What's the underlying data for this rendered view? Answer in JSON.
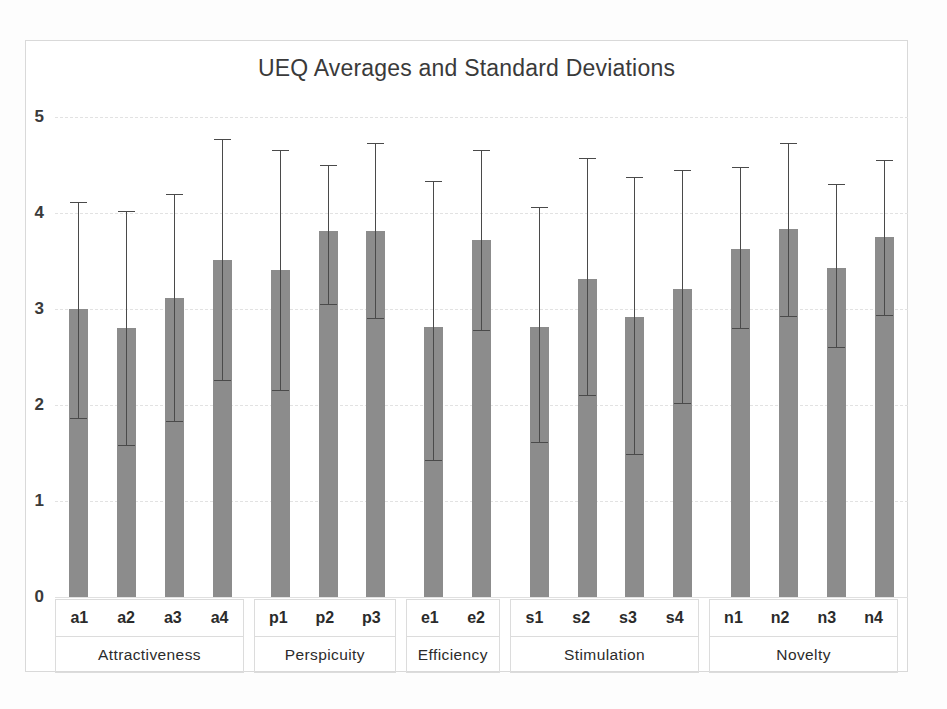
{
  "chart_data": {
    "type": "bar",
    "title": "UEQ Averages and Standard Deviations",
    "xlabel": "",
    "ylabel": "",
    "ylim": [
      0,
      5
    ],
    "yticks": [
      "0",
      "1",
      "2",
      "3",
      "4",
      "5"
    ],
    "grid": true,
    "legend": "none",
    "error_bars": "standard deviation",
    "categories": [
      "a1",
      "a2",
      "a3",
      "a4",
      "p1",
      "p2",
      "p3",
      "e1",
      "e2",
      "s1",
      "s2",
      "s3",
      "s4",
      "n1",
      "n2",
      "n3",
      "n4"
    ],
    "values": [
      3.0,
      2.8,
      3.11,
      3.51,
      3.41,
      3.81,
      3.81,
      2.81,
      3.72,
      2.81,
      3.31,
      2.92,
      3.21,
      3.63,
      3.83,
      3.43,
      3.75
    ],
    "err_upper": [
      4.11,
      4.02,
      4.2,
      4.77,
      4.66,
      4.5,
      4.73,
      4.33,
      4.66,
      4.06,
      4.57,
      4.37,
      4.45,
      4.48,
      4.73,
      4.3,
      4.55
    ],
    "err_lower": [
      1.85,
      1.57,
      1.82,
      2.25,
      2.15,
      3.04,
      2.9,
      1.42,
      2.77,
      1.6,
      2.09,
      1.48,
      2.01,
      2.79,
      2.92,
      2.59,
      2.93
    ],
    "groups": [
      {
        "label": "Attractiveness",
        "items": [
          "a1",
          "a2",
          "a3",
          "a4"
        ]
      },
      {
        "label": "Perspicuity",
        "items": [
          "p1",
          "p2",
          "p3"
        ]
      },
      {
        "label": "Efficiency",
        "items": [
          "e1",
          "e2"
        ]
      },
      {
        "label": "Stimulation",
        "items": [
          "s1",
          "s2",
          "s3",
          "s4"
        ]
      },
      {
        "label": "Novelty",
        "items": [
          "n1",
          "n2",
          "n3",
          "n4"
        ]
      }
    ],
    "colors": {
      "bar": "#8c8c8c",
      "error_bar": "#4a4a4a",
      "grid": "#e2e2e2",
      "text": "#2b2b2b",
      "background": "#ffffff"
    }
  }
}
